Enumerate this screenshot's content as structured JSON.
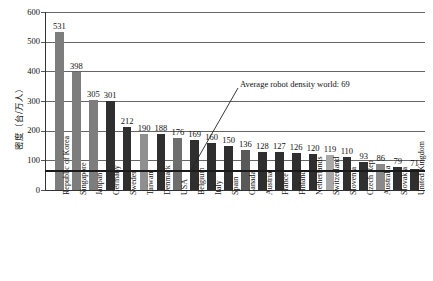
{
  "chart_data": {
    "type": "bar",
    "title": "",
    "subtitle": "",
    "xlabel": "",
    "ylabel": "密度（台/万人）",
    "ylim": [
      0,
      600
    ],
    "yticks": [
      0,
      100,
      200,
      300,
      400,
      500,
      600
    ],
    "grid": true,
    "legend": "none",
    "categories": [
      "Republic of Korea",
      "Singapore",
      "Janpan",
      "Germany",
      "Sweden",
      "Taiwan",
      "Denmark",
      "USA",
      "Belgium",
      "Italy",
      "Spain",
      "Canada",
      "Austria",
      "France",
      "Finland",
      "Netherlands",
      "Switzerland",
      "Slovenia",
      "Czech Rep",
      "Australia",
      "Slovakia",
      "United Kingdom"
    ],
    "values": [
      531,
      398,
      305,
      301,
      212,
      190,
      188,
      176,
      169,
      160,
      150,
      136,
      128,
      127,
      126,
      120,
      119,
      110,
      93,
      86,
      79,
      71
    ],
    "bar_colors": [
      "#7d7d7d",
      "#7d7d7d",
      "#7d7d7d",
      "#2f2f2f",
      "#2f2f2f",
      "#8f8f8f",
      "#2f2f2f",
      "#6e6e6e",
      "#2f2f2f",
      "#2f2f2f",
      "#2f2f2f",
      "#595959",
      "#2f2f2f",
      "#2f2f2f",
      "#2f2f2f",
      "#2f2f2f",
      "#a8a8a8",
      "#2f2f2f",
      "#2f2f2f",
      "#8a8a8a",
      "#2f2f2f",
      "#2f2f2f"
    ],
    "annotations": [
      {
        "id": "world-average",
        "text": "Average robot density world:  69",
        "value": 69
      }
    ]
  }
}
